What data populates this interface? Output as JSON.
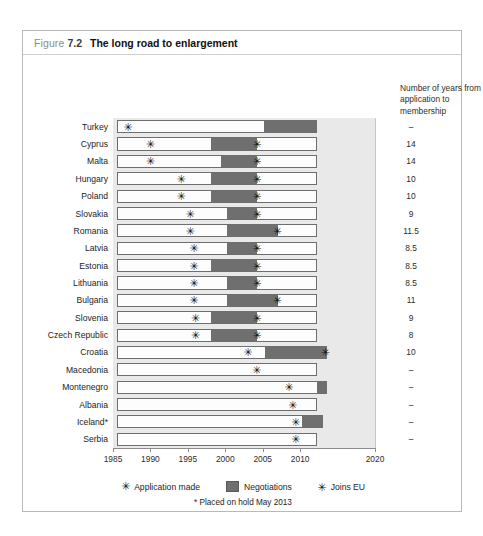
{
  "figure": {
    "label": "Figure",
    "number": "7.2",
    "title": "The long road to enlargement"
  },
  "right_note": "Number of years from application to membership",
  "legend": {
    "application": "Application made",
    "negotiations": "Negotiations",
    "joins": "Joins EU",
    "star_glyph": "✳",
    "footnote": "* Placed on hold May 2013"
  },
  "colors": {
    "negotiations_fill": "#6f6f6f",
    "bar_outline": "#6e6e6e",
    "bar_fill": "#fdfdfd",
    "panel_background": "#e9e9e9",
    "frame_border": "#b9b9b9",
    "text": "#1d1d1d"
  },
  "chart_data": {
    "type": "bar",
    "title": "The long road to enlargement",
    "subtitle": "",
    "xlabel": "",
    "ylabel": "",
    "xlim": [
      1985,
      2020
    ],
    "xticks": [
      1985,
      1990,
      1995,
      2000,
      2005,
      2010,
      2020
    ],
    "xtick_labels": [
      "1985",
      "1990",
      "1995",
      "2000",
      "2005",
      "2010",
      "2020"
    ],
    "grid": false,
    "legend_position": "bottom",
    "series": [
      {
        "name": "Application made",
        "marker": "asterisk"
      },
      {
        "name": "Negotiations",
        "marker": "bar-segment"
      },
      {
        "name": "Joins EU",
        "marker": "bold-asterisk"
      }
    ],
    "categories": [
      "Turkey",
      "Cyprus",
      "Malta",
      "Hungary",
      "Poland",
      "Slovakia",
      "Romania",
      "Latvia",
      "Estonia",
      "Lithuania",
      "Bulgaria",
      "Slovenia",
      "Czech Republic",
      "Croatia",
      "Macedonia",
      "Montenegro",
      "Albania",
      "Iceland*",
      "Serbia"
    ],
    "rows": [
      {
        "country": "Turkey",
        "bar_start": 1985.6,
        "bar_end": 2012.3,
        "application": 1987.0,
        "negotiation_start": 2005.2,
        "negotiation_end": 2012.3,
        "joins": null,
        "years": "–"
      },
      {
        "country": "Cyprus",
        "bar_start": 1985.6,
        "bar_end": 2012.3,
        "application": 1990.0,
        "negotiation_start": 1998.1,
        "negotiation_end": 2004.3,
        "joins": 2004.3,
        "years": "14"
      },
      {
        "country": "Malta",
        "bar_start": 1985.6,
        "bar_end": 2012.3,
        "application": 1990.0,
        "negotiation_start": 1999.4,
        "negotiation_end": 2004.3,
        "joins": 2004.3,
        "years": "14"
      },
      {
        "country": "Hungary",
        "bar_start": 1985.6,
        "bar_end": 2012.3,
        "application": 1994.1,
        "negotiation_start": 1998.1,
        "negotiation_end": 2004.3,
        "joins": 2004.3,
        "years": "10"
      },
      {
        "country": "Poland",
        "bar_start": 1985.6,
        "bar_end": 2012.3,
        "application": 1994.1,
        "negotiation_start": 1998.1,
        "negotiation_end": 2004.3,
        "joins": 2004.3,
        "years": "10"
      },
      {
        "country": "Slovakia",
        "bar_start": 1985.6,
        "bar_end": 2012.3,
        "application": 1995.3,
        "negotiation_start": 2000.2,
        "negotiation_end": 2004.3,
        "joins": 2004.3,
        "years": "9"
      },
      {
        "country": "Romania",
        "bar_start": 1985.6,
        "bar_end": 2012.3,
        "application": 1995.3,
        "negotiation_start": 2000.2,
        "negotiation_end": 2007.0,
        "joins": 2007.0,
        "years": "11.5"
      },
      {
        "country": "Latvia",
        "bar_start": 1985.6,
        "bar_end": 2012.3,
        "application": 1995.8,
        "negotiation_start": 2000.2,
        "negotiation_end": 2004.3,
        "joins": 2004.3,
        "years": "8.5"
      },
      {
        "country": "Estonia",
        "bar_start": 1985.6,
        "bar_end": 2012.3,
        "application": 1995.8,
        "negotiation_start": 1998.1,
        "negotiation_end": 2004.3,
        "joins": 2004.3,
        "years": "8.5"
      },
      {
        "country": "Lithuania",
        "bar_start": 1985.6,
        "bar_end": 2012.3,
        "application": 1995.8,
        "negotiation_start": 2000.2,
        "negotiation_end": 2004.3,
        "joins": 2004.3,
        "years": "8.5"
      },
      {
        "country": "Bulgaria",
        "bar_start": 1985.6,
        "bar_end": 2012.3,
        "application": 1995.8,
        "negotiation_start": 2000.2,
        "negotiation_end": 2007.0,
        "joins": 2007.0,
        "years": "11"
      },
      {
        "country": "Slovenia",
        "bar_start": 1985.6,
        "bar_end": 2012.3,
        "application": 1996.0,
        "negotiation_start": 1998.1,
        "negotiation_end": 2004.3,
        "joins": 2004.3,
        "years": "9"
      },
      {
        "country": "Czech Republic",
        "bar_start": 1985.6,
        "bar_end": 2012.3,
        "application": 1996.0,
        "negotiation_start": 1998.1,
        "negotiation_end": 2004.3,
        "joins": 2004.3,
        "years": "8"
      },
      {
        "country": "Croatia",
        "bar_start": 1985.6,
        "bar_end": 2013.6,
        "application": 2003.0,
        "negotiation_start": 2005.3,
        "negotiation_end": 2013.6,
        "joins": 2013.4,
        "years": "10"
      },
      {
        "country": "Macedonia",
        "bar_start": 1985.6,
        "bar_end": 2012.3,
        "application": 2004.2,
        "negotiation_start": null,
        "negotiation_end": null,
        "joins": null,
        "years": "–"
      },
      {
        "country": "Montenegro",
        "bar_start": 1985.6,
        "bar_end": 2013.6,
        "application": 2008.5,
        "negotiation_start": 2012.2,
        "negotiation_end": 2013.6,
        "joins": null,
        "years": "–"
      },
      {
        "country": "Albania",
        "bar_start": 1985.6,
        "bar_end": 2012.3,
        "application": 2009.0,
        "negotiation_start": null,
        "negotiation_end": null,
        "joins": null,
        "years": "–"
      },
      {
        "country": "Iceland*",
        "bar_start": 1985.6,
        "bar_end": 2013.0,
        "application": 2009.4,
        "negotiation_start": 2010.2,
        "negotiation_end": 2013.0,
        "joins": null,
        "years": "–"
      },
      {
        "country": "Serbia",
        "bar_start": 1985.6,
        "bar_end": 2012.3,
        "application": 2009.4,
        "negotiation_start": null,
        "negotiation_end": null,
        "joins": null,
        "years": "–"
      }
    ]
  }
}
